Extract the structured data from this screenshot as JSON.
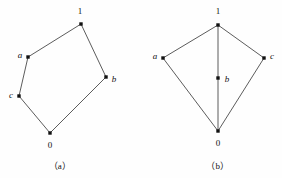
{
  "figure": {
    "background_color": "#fefefe",
    "line_color": "#4a4a4a",
    "node_color": "#111111",
    "text_color": "#111111"
  },
  "diagrams": [
    {
      "id": "a",
      "caption": "（a）",
      "caption_position": {
        "x": 60,
        "y": 166
      },
      "shape": "pentagon",
      "nodes": [
        {
          "id": "n1",
          "label": "1",
          "style": "upright",
          "x": 81,
          "y": 24,
          "label_x": 80,
          "label_y": 11
        },
        {
          "id": "na",
          "label": "a",
          "style": "italic",
          "x": 28,
          "y": 57,
          "label_x": 20,
          "label_y": 55
        },
        {
          "id": "nb",
          "label": "b",
          "style": "italic",
          "x": 106,
          "y": 77,
          "label_x": 114,
          "label_y": 79
        },
        {
          "id": "nc",
          "label": "c",
          "style": "italic",
          "x": 19,
          "y": 96,
          "label_x": 11,
          "label_y": 95
        },
        {
          "id": "n0",
          "label": "0",
          "style": "upright",
          "x": 50,
          "y": 133,
          "label_x": 50,
          "label_y": 145
        }
      ],
      "edges": [
        {
          "from": "n1",
          "to": "na"
        },
        {
          "from": "na",
          "to": "nc"
        },
        {
          "from": "nc",
          "to": "n0"
        },
        {
          "from": "n0",
          "to": "nb"
        },
        {
          "from": "nb",
          "to": "n1"
        }
      ]
    },
    {
      "id": "b",
      "caption": "（b）",
      "caption_position": {
        "x": 77,
        "y": 166
      },
      "shape": "kite-with-median",
      "nodes": [
        {
          "id": "n1",
          "label": "1",
          "style": "upright",
          "x": 77,
          "y": 25,
          "label_x": 77,
          "label_y": 11
        },
        {
          "id": "na",
          "label": "a",
          "style": "italic",
          "x": 22,
          "y": 58,
          "label_x": 14,
          "label_y": 56
        },
        {
          "id": "nc",
          "label": "c",
          "style": "italic",
          "x": 123,
          "y": 58,
          "label_x": 131,
          "label_y": 56
        },
        {
          "id": "nb",
          "label": "b",
          "style": "italic",
          "x": 77,
          "y": 78,
          "label_x": 86,
          "label_y": 79
        },
        {
          "id": "n0",
          "label": "0",
          "style": "upright",
          "x": 77,
          "y": 131,
          "label_x": 77,
          "label_y": 143
        }
      ],
      "edges": [
        {
          "from": "n1",
          "to": "na"
        },
        {
          "from": "n1",
          "to": "nc"
        },
        {
          "from": "n1",
          "to": "n0"
        },
        {
          "from": "na",
          "to": "n0"
        },
        {
          "from": "nc",
          "to": "n0"
        }
      ]
    }
  ]
}
